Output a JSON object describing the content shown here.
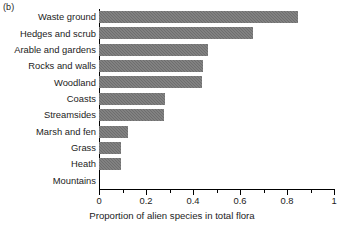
{
  "figure": {
    "panel_label": "(b)",
    "background": "#ffffff",
    "bar_color": "#6e6e6e",
    "axis_color": "#000000"
  },
  "chart_data": {
    "type": "bar",
    "orientation": "horizontal",
    "title": "",
    "subtitle": "",
    "xlabel": "Proportion of alien species in total flora",
    "ylabel": "",
    "categories": [
      "Waste ground",
      "Hedges and scrub",
      "Arable and gardens",
      "Rocks and walls",
      "Woodland",
      "Coasts",
      "Streamsides",
      "Marsh and fen",
      "Grass",
      "Heath",
      "Mountains"
    ],
    "values": [
      0.845,
      0.655,
      0.462,
      0.442,
      0.437,
      0.281,
      0.277,
      0.123,
      0.094,
      0.094,
      0.0
    ],
    "xlim": [
      0,
      1
    ],
    "xticks": [
      "0",
      "0.2",
      "0.4",
      "0.6",
      "0.8",
      "1"
    ],
    "xtick_values": [
      0,
      0.2,
      0.4,
      0.6,
      0.8,
      1
    ],
    "xminor_ticks": [
      0.1,
      0.3,
      0.5,
      0.7,
      0.9
    ],
    "grid": false,
    "legend": null,
    "legend_position": "none"
  }
}
